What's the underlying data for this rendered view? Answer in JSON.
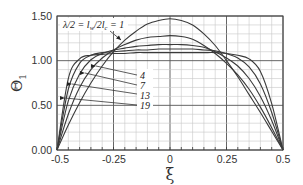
{
  "chart_data": {
    "type": "line",
    "title": "",
    "xlabel": "ξ",
    "ylabel": "Θ₁",
    "xlim": [
      -0.5,
      0.5
    ],
    "ylim": [
      0.0,
      1.5
    ],
    "x_ticks": [
      "-0.5",
      "-0.25",
      "0",
      "0.25",
      "0.5"
    ],
    "y_ticks": [
      "0.00",
      "0.50",
      "1.00",
      "1.50"
    ],
    "grid": true,
    "legend": "inline annotations",
    "annotations": [
      {
        "text": "λ/2 = l_w/2l_c = 1",
        "target_series": "1"
      },
      {
        "text": "4",
        "target_series": "4"
      },
      {
        "text": "7",
        "target_series": "7"
      },
      {
        "text": "13",
        "target_series": "13"
      },
      {
        "text": "19",
        "target_series": "19"
      }
    ],
    "x": [
      -0.5,
      -0.45,
      -0.4,
      -0.35,
      -0.3,
      -0.25,
      -0.2,
      -0.15,
      -0.1,
      -0.05,
      0.0,
      0.05,
      0.1,
      0.15,
      0.2,
      0.25,
      0.3,
      0.35,
      0.4,
      0.45,
      0.5
    ],
    "series": [
      {
        "name": "1",
        "values": [
          0.0,
          0.28,
          0.53,
          0.75,
          0.94,
          1.1,
          1.23,
          1.33,
          1.41,
          1.45,
          1.47,
          1.45,
          1.4,
          1.3,
          1.17,
          1.0,
          0.82,
          0.62,
          0.42,
          0.21,
          0.0
        ]
      },
      {
        "name": "4",
        "values": [
          0.0,
          0.4,
          0.7,
          0.9,
          1.03,
          1.12,
          1.18,
          1.23,
          1.26,
          1.27,
          1.28,
          1.27,
          1.24,
          1.17,
          1.08,
          0.97,
          0.84,
          0.68,
          0.48,
          0.25,
          0.0
        ]
      },
      {
        "name": "7",
        "values": [
          0.0,
          0.55,
          0.85,
          1.01,
          1.08,
          1.12,
          1.14,
          1.16,
          1.17,
          1.18,
          1.18,
          1.18,
          1.17,
          1.15,
          1.1,
          1.03,
          0.94,
          0.8,
          0.6,
          0.33,
          0.0
        ]
      },
      {
        "name": "13",
        "values": [
          0.0,
          0.68,
          0.97,
          1.06,
          1.09,
          1.1,
          1.11,
          1.12,
          1.12,
          1.13,
          1.13,
          1.13,
          1.13,
          1.12,
          1.11,
          1.08,
          1.03,
          0.93,
          0.74,
          0.42,
          0.0
        ]
      },
      {
        "name": "19",
        "values": [
          0.0,
          0.8,
          1.02,
          1.06,
          1.07,
          1.08,
          1.08,
          1.09,
          1.09,
          1.09,
          1.09,
          1.09,
          1.09,
          1.09,
          1.09,
          1.08,
          1.06,
          1.02,
          0.88,
          0.52,
          0.0
        ]
      }
    ]
  },
  "labels": {
    "x_axis_title": "ξ",
    "y_axis_title": "Θ",
    "y_axis_subscript": "1",
    "annotation_main": "λ/2 = l",
    "annotation_main_sub1": "w",
    "annotation_main_mid": "/2l",
    "annotation_main_sub2": "c",
    "annotation_main_end": " = 1",
    "curve_4": "4",
    "curve_7": "7",
    "curve_13": "13",
    "curve_19": "19",
    "tick_x0": "-0.5",
    "tick_x1": "-0.25",
    "tick_x2": "0",
    "tick_x3": "0.25",
    "tick_x4": "0.5",
    "tick_y0": "0.00",
    "tick_y1": "0.50",
    "tick_y2": "1.00",
    "tick_y3": "1.50"
  }
}
